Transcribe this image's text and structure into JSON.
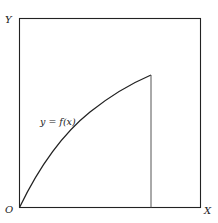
{
  "diagram": {
    "type": "function-graph",
    "axes": {
      "x_label": "X",
      "y_label": "Y",
      "origin_label": "O"
    },
    "curve": {
      "label": "y = f(x)",
      "shape": "concave increasing from origin",
      "end_marker": "vertical line to x-axis"
    },
    "colors": {
      "stroke": "#222222",
      "vertical": "#555555",
      "background": "#ffffff"
    }
  }
}
